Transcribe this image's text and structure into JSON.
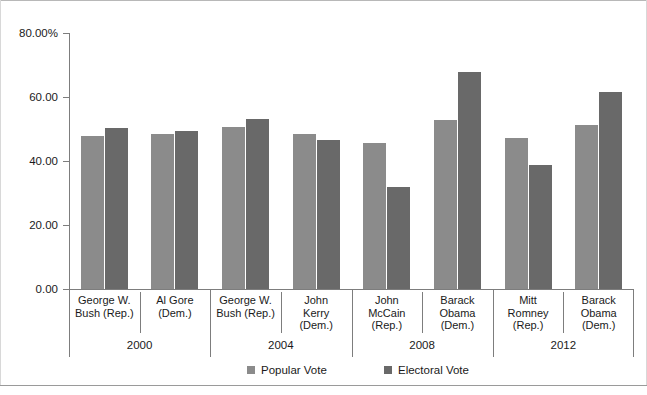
{
  "chart_data": {
    "type": "bar",
    "title": "",
    "xlabel": "",
    "ylabel": "",
    "ylim": [
      0,
      80
    ],
    "grid": false,
    "legend_position": "bottom",
    "y_ticks": [
      "0.00",
      "20.00",
      "40.00",
      "60.00",
      "80.00%"
    ],
    "y_tick_values": [
      0,
      20,
      40,
      60,
      80
    ],
    "categories": [
      "George W. Bush (Rep.)",
      "Al Gore (Dem.)",
      "George W. Bush (Rep.)",
      "John Kerry (Dem.)",
      "John McCain (Rep.)",
      "Barack Obama (Dem.)",
      "Mitt Romney (Rep.)",
      "Barack Obama (Dem.)"
    ],
    "category_lines": [
      [
        "George W.",
        "Bush (Rep.)"
      ],
      [
        "Al Gore",
        "(Dem.)"
      ],
      [
        "George W.",
        "Bush (Rep.)"
      ],
      [
        "John",
        "Kerry",
        "(Dem.)"
      ],
      [
        "John",
        "McCain",
        "(Rep.)"
      ],
      [
        "Barack",
        "Obama",
        "(Dem.)"
      ],
      [
        "Mitt",
        "Romney",
        "(Rep.)"
      ],
      [
        "Barack",
        "Obama",
        "(Dem.)"
      ]
    ],
    "groups": [
      {
        "year": "2000",
        "categories": [
          0,
          1
        ]
      },
      {
        "year": "2004",
        "categories": [
          2,
          3
        ]
      },
      {
        "year": "2008",
        "categories": [
          4,
          5
        ]
      },
      {
        "year": "2012",
        "categories": [
          6,
          7
        ]
      }
    ],
    "series": [
      {
        "name": "Popular Vote",
        "color": "#8b8b8b",
        "values": [
          47.9,
          48.4,
          50.7,
          48.3,
          45.7,
          52.9,
          47.2,
          51.1
        ]
      },
      {
        "name": "Electoral Vote",
        "color": "#696969",
        "values": [
          50.4,
          49.4,
          53.2,
          46.7,
          31.9,
          67.8,
          38.6,
          61.7
        ]
      }
    ],
    "legend": [
      {
        "label": "Popular Vote",
        "color": "#8b8b8b"
      },
      {
        "label": "Electoral Vote",
        "color": "#696969"
      }
    ]
  }
}
